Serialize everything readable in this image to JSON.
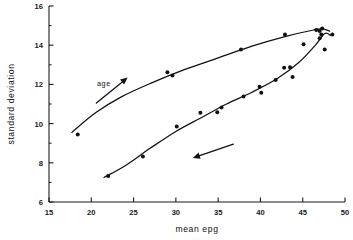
{
  "chart_data": {
    "type": "scatter",
    "title": "",
    "xlabel": "mean epg",
    "ylabel": "standard deviation",
    "xlim": [
      15,
      50
    ],
    "ylim": [
      6,
      16
    ],
    "x_ticks": [
      15,
      20,
      25,
      30,
      35,
      40,
      45,
      50
    ],
    "y_ticks": [
      6,
      8,
      10,
      12,
      14,
      16
    ],
    "x_minor_ticks": [],
    "y_minor_ticks": [
      7,
      9,
      11,
      13,
      15
    ],
    "grid": false,
    "legend": null,
    "series": [
      {
        "name": "upper branch",
        "marker": "filled-circle",
        "points": [
          [
            18.4,
            9.45
          ],
          [
            29.0,
            12.62
          ],
          [
            29.6,
            12.45
          ],
          [
            37.7,
            13.78
          ],
          [
            42.9,
            14.55
          ],
          [
            46.6,
            14.78
          ],
          [
            47.0,
            14.72
          ],
          [
            47.2,
            14.55
          ],
          [
            47.3,
            14.85
          ],
          [
            48.5,
            14.55
          ]
        ]
      },
      {
        "name": "lower branch",
        "marker": "filled-circle",
        "points": [
          [
            22.0,
            7.33
          ],
          [
            26.1,
            8.32
          ],
          [
            30.1,
            9.85
          ],
          [
            32.9,
            10.55
          ],
          [
            34.9,
            10.58
          ],
          [
            35.4,
            10.82
          ],
          [
            38.0,
            11.38
          ],
          [
            39.9,
            11.88
          ],
          [
            40.1,
            11.58
          ],
          [
            41.8,
            12.22
          ],
          [
            42.8,
            12.85
          ],
          [
            43.5,
            12.88
          ],
          [
            43.8,
            12.38
          ],
          [
            45.1,
            14.05
          ],
          [
            47.0,
            14.35
          ],
          [
            47.6,
            13.78
          ]
        ]
      }
    ],
    "fitted_curves": [
      {
        "name": "upper fitted curve",
        "points": [
          [
            17.7,
            9.55
          ],
          [
            20.5,
            10.55
          ],
          [
            23.5,
            11.35
          ],
          [
            27.0,
            12.05
          ],
          [
            31.0,
            12.75
          ],
          [
            35.0,
            13.35
          ],
          [
            39.0,
            13.95
          ],
          [
            43.0,
            14.45
          ],
          [
            46.0,
            14.75
          ],
          [
            47.3,
            14.83
          ],
          [
            48.2,
            14.72
          ]
        ]
      },
      {
        "name": "lower fitted curve",
        "points": [
          [
            21.5,
            7.25
          ],
          [
            24.0,
            7.85
          ],
          [
            27.0,
            8.75
          ],
          [
            30.0,
            9.6
          ],
          [
            33.0,
            10.3
          ],
          [
            36.0,
            11.0
          ],
          [
            39.0,
            11.6
          ],
          [
            42.0,
            12.3
          ],
          [
            44.5,
            13.1
          ],
          [
            46.5,
            14.0
          ],
          [
            47.6,
            14.6
          ],
          [
            48.3,
            14.5
          ]
        ]
      }
    ],
    "annotations": [
      {
        "name": "age-annotation",
        "text": "age",
        "text_x": 21.5,
        "text_y": 12.05,
        "arrow_from": [
          20.6,
          11.05
        ],
        "arrow_to": [
          24.3,
          12.35
        ]
      },
      {
        "name": "direction-annotation",
        "text": "",
        "arrow_from": [
          36.8,
          8.95
        ],
        "arrow_to": [
          32.0,
          8.25
        ]
      }
    ]
  }
}
